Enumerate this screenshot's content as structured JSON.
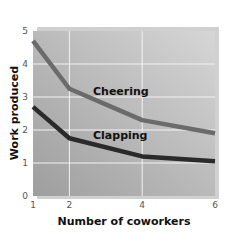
{
  "chart_data": {
    "type": "line",
    "title": "",
    "xlabel": "Number of coworkers",
    "ylabel": "Work produced",
    "x": [
      1,
      2,
      4,
      6
    ],
    "xticks": [
      "1",
      "2",
      "4",
      "6"
    ],
    "yticks": [
      "0",
      "1",
      "2",
      "3",
      "4",
      "5"
    ],
    "xlim": [
      1,
      6
    ],
    "ylim": [
      0,
      5
    ],
    "grid": true,
    "legend": "inline labels",
    "series": [
      {
        "name": "Cheering",
        "values": [
          4.7,
          3.25,
          2.3,
          1.9
        ],
        "color": "#6b6b6b"
      },
      {
        "name": "Clapping",
        "values": [
          2.7,
          1.75,
          1.2,
          1.05
        ],
        "color": "#2a2a2a"
      }
    ]
  },
  "labels": {
    "cheering": "Cheering",
    "clapping": "Clapping",
    "xlabel": "Number of coworkers",
    "ylabel": "Work produced"
  },
  "colors": {
    "plot_bg_left": "#a8a8a8",
    "plot_bg_right": "#d4d4d4",
    "grid": "#f2f2f2",
    "shadow": "#cfcfcf"
  }
}
